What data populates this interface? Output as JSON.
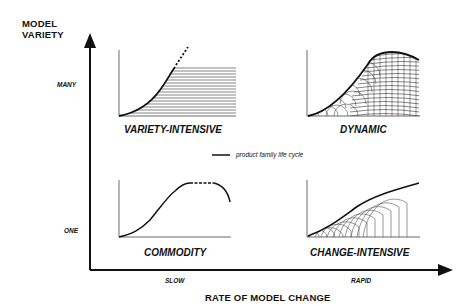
{
  "y_axis": {
    "title_line1": "MODEL",
    "title_line2": "VARIETY",
    "ticks": [
      "MANY",
      "ONE"
    ]
  },
  "x_axis": {
    "title": "RATE OF MODEL CHANGE",
    "ticks": [
      "SLOW",
      "RAPID"
    ]
  },
  "panels": [
    {
      "label": "VARIETY-INTENSIVE",
      "position": "top-left",
      "variety": "MANY",
      "rate": "SLOW"
    },
    {
      "label": "DYNAMIC",
      "position": "top-right",
      "variety": "MANY",
      "rate": "RAPID"
    },
    {
      "label": "COMMODITY",
      "position": "bottom-left",
      "variety": "ONE",
      "rate": "SLOW"
    },
    {
      "label": "CHANGE-INTENSIVE",
      "position": "bottom-right",
      "variety": "ONE",
      "rate": "RAPID"
    }
  ],
  "legend": {
    "label": "product family life cycle"
  },
  "colors": {
    "ink": "#111111",
    "background": "#ffffff"
  }
}
